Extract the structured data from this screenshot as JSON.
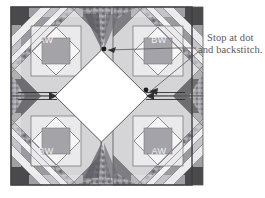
{
  "figure": {
    "type": "quilt-block-assembly-diagram",
    "background": "#ffffff",
    "block": {
      "x": 11,
      "y": 7,
      "width": 181,
      "height": 178,
      "border_color": "#3f3f42"
    },
    "quadrant_labels": [
      {
        "id": "top-left",
        "text": "AW",
        "x": 45,
        "y": 41
      },
      {
        "id": "top-right",
        "text": "BW",
        "x": 158,
        "y": 41
      },
      {
        "id": "bottom-left",
        "text": "BW",
        "x": 45,
        "y": 152
      },
      {
        "id": "bottom-right",
        "text": "AW",
        "x": 158,
        "y": 152
      }
    ],
    "center_patch": {
      "name": "center-diamond",
      "fill": "#ffffff",
      "stroke": "#5a5a5d"
    },
    "colors": {
      "dark": "#4a4a4d",
      "mid_dark": "#6e6e71",
      "mid": "#909094",
      "light": "#c9c9cb",
      "pale": "#e2e2e4",
      "white": "#ffffff",
      "line": "#55555a",
      "text": "#59595b"
    },
    "arrows": [
      {
        "name": "seam-arrow-left",
        "direction": "right",
        "style": "double-line"
      },
      {
        "name": "seam-arrow-right",
        "direction": "left",
        "style": "double-line"
      }
    ],
    "dots": [
      {
        "name": "stop-dot-top",
        "x": 105,
        "y": 48
      },
      {
        "name": "stop-dot-right",
        "x": 146,
        "y": 90
      }
    ]
  },
  "annotation": {
    "name": "stop-at-dot-note",
    "line1": "Stop at dot",
    "line2": "and backstitch.",
    "x": 199,
    "y": 33,
    "leader_targets": [
      "stop-dot-top",
      "stop-dot-right"
    ]
  }
}
